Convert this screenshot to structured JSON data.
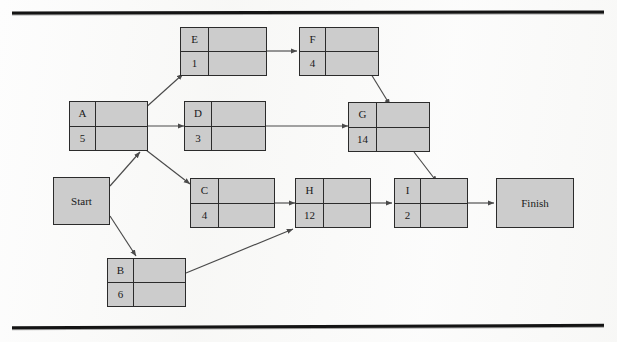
{
  "page": {
    "header_text": "",
    "background_color": "#fdfdfd",
    "rule_color": "#141414",
    "node_fill_color": "#cccccc",
    "node_border_color": "#2b2b2b",
    "arrow_color": "#4a4a4a"
  },
  "diagram": {
    "type": "activity-on-node project network",
    "start": {
      "label": "Start"
    },
    "finish": {
      "label": "Finish"
    },
    "nodes": [
      {
        "id": "A",
        "label": "A",
        "duration": "5"
      },
      {
        "id": "B",
        "label": "B",
        "duration": "6"
      },
      {
        "id": "C",
        "label": "C",
        "duration": "4"
      },
      {
        "id": "D",
        "label": "D",
        "duration": "3"
      },
      {
        "id": "E",
        "label": "E",
        "duration": "1"
      },
      {
        "id": "F",
        "label": "F",
        "duration": "4"
      },
      {
        "id": "G",
        "label": "G",
        "duration": "14"
      },
      {
        "id": "H",
        "label": "H",
        "duration": "12"
      },
      {
        "id": "I",
        "label": "I",
        "duration": "2"
      }
    ],
    "edges": [
      {
        "from": "Start",
        "to": "A"
      },
      {
        "from": "Start",
        "to": "B"
      },
      {
        "from": "A",
        "to": "E"
      },
      {
        "from": "A",
        "to": "D"
      },
      {
        "from": "A",
        "to": "C"
      },
      {
        "from": "B",
        "to": "H"
      },
      {
        "from": "C",
        "to": "H"
      },
      {
        "from": "D",
        "to": "G"
      },
      {
        "from": "E",
        "to": "F"
      },
      {
        "from": "F",
        "to": "G"
      },
      {
        "from": "G",
        "to": "I"
      },
      {
        "from": "H",
        "to": "I"
      },
      {
        "from": "I",
        "to": "Finish"
      }
    ]
  }
}
